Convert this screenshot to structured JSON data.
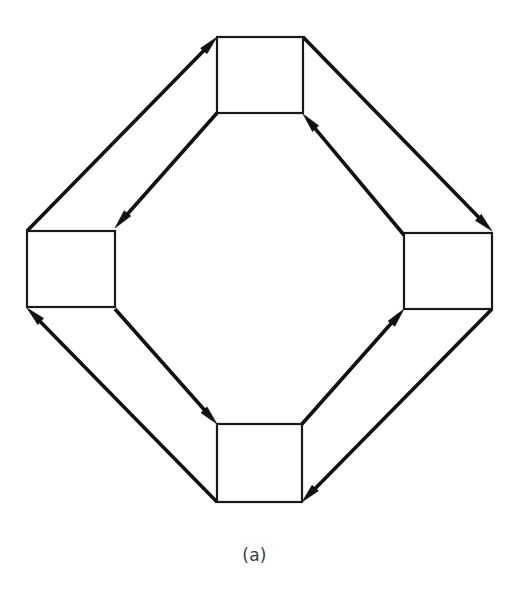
{
  "figure": {
    "caption": "(a)",
    "kind": "ring-network-topology-diagram",
    "background_color": "#ffffff",
    "line_color": "#111111",
    "box_fill_color": "#ffffff",
    "box_border_color": "#1a1a1a",
    "caption_color": "#3a3a3a"
  },
  "nodes": [
    {
      "id": "top",
      "label": "",
      "x": 217,
      "y": 37,
      "width": 86,
      "height": 76
    },
    {
      "id": "left",
      "label": "",
      "x": 27,
      "y": 231,
      "width": 88,
      "height": 76
    },
    {
      "id": "right",
      "label": "",
      "x": 404,
      "y": 233,
      "width": 88,
      "height": 76
    },
    {
      "id": "bottom",
      "label": "",
      "x": 217,
      "y": 424,
      "width": 85,
      "height": 78
    }
  ],
  "links": [
    {
      "id": "left-to-top",
      "from": "left",
      "to": "top",
      "x1": 27,
      "y1": 231,
      "x2": 217,
      "y2": 37,
      "direction": "up-right",
      "head_at": "end"
    },
    {
      "id": "top-to-left",
      "from": "top",
      "to": "left",
      "x1": 217,
      "y1": 113,
      "x2": 115,
      "y2": 228,
      "direction": "down-left",
      "head_at": "end"
    },
    {
      "id": "top-to-right",
      "from": "top",
      "to": "right",
      "x1": 303,
      "y1": 37,
      "x2": 492,
      "y2": 231,
      "direction": "down-right",
      "head_at": "end"
    },
    {
      "id": "right-to-top",
      "from": "right",
      "to": "top",
      "x1": 404,
      "y1": 235,
      "x2": 303,
      "y2": 114,
      "direction": "up-left",
      "head_at": "end"
    },
    {
      "id": "left-to-bottom",
      "from": "left",
      "to": "bottom",
      "x1": 115,
      "y1": 309,
      "x2": 217,
      "y2": 424,
      "direction": "down-right",
      "head_at": "end"
    },
    {
      "id": "bottom-to-left",
      "from": "bottom",
      "to": "left",
      "x1": 217,
      "y1": 502,
      "x2": 27,
      "y2": 308,
      "direction": "up-left",
      "head_at": "end"
    },
    {
      "id": "bottom-to-right",
      "from": "bottom",
      "to": "right",
      "x1": 302,
      "y1": 424,
      "x2": 404,
      "y2": 309,
      "direction": "up-right",
      "head_at": "end"
    },
    {
      "id": "right-to-bottom",
      "from": "right",
      "to": "bottom",
      "x1": 492,
      "y1": 309,
      "x2": 302,
      "y2": 502,
      "direction": "down-left",
      "head_at": "end"
    }
  ]
}
